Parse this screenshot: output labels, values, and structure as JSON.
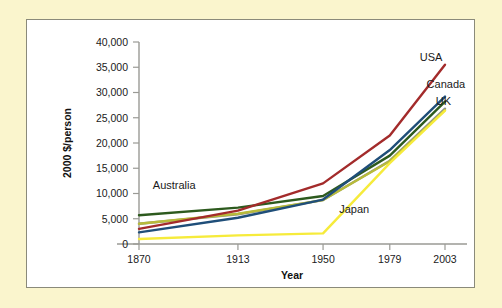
{
  "figure": {
    "background_color": "#faf5cd",
    "panel_color": "#ffffff",
    "panel_border_color": "#8a8a7a"
  },
  "chart_data": {
    "type": "line",
    "title": "",
    "xlabel": "Year",
    "ylabel": "2000 $/person",
    "categories": [
      "1870",
      "1913",
      "1950",
      "1979",
      "2003"
    ],
    "x": [
      1870,
      1913,
      1950,
      1979,
      2003
    ],
    "xlim": [
      1870,
      2003
    ],
    "ylim": [
      0,
      40000
    ],
    "yticks": [
      0,
      5000,
      10000,
      15000,
      20000,
      25000,
      30000,
      35000,
      40000
    ],
    "ytick_labels": [
      "0",
      "5,000",
      "10,000",
      "15,000",
      "20,000",
      "25,000",
      "30,000",
      "35,000",
      "40,000"
    ],
    "xtick_labels": [
      "1870",
      "1913",
      "1950",
      "1979",
      "2003"
    ],
    "grid": false,
    "legend_position": "inline-annotations",
    "series": [
      {
        "name": "USA",
        "color": "#a32b2b",
        "label": "USA",
        "values": [
          3000,
          6600,
          12000,
          21500,
          35500
        ]
      },
      {
        "name": "Canada",
        "color": "#1f4e79",
        "label": "Canada",
        "values": [
          2300,
          5200,
          8800,
          18600,
          29200
        ]
      },
      {
        "name": "Australia",
        "color": "#2d5a1e",
        "label": "Australia",
        "values": [
          5700,
          7200,
          9500,
          17500,
          28200
        ]
      },
      {
        "name": "UK",
        "color": "#b8bb3a",
        "label": "UK",
        "values": [
          4000,
          6000,
          8700,
          16400,
          26500
        ]
      },
      {
        "name": "Unlabeled-gray",
        "color": "#8f9190",
        "label": "",
        "values": [
          4000,
          5900,
          8700,
          16500,
          26800
        ]
      },
      {
        "name": "Japan",
        "color": "#f6eb3b",
        "label": "Japan",
        "values": [
          1000,
          1700,
          2100,
          16000,
          26400
        ]
      }
    ],
    "annotations": [
      {
        "text": "Australia",
        "series": "Australia",
        "x": 1876,
        "y": 10800
      },
      {
        "text": "Japan",
        "series": "Japan",
        "x": 1957,
        "y": 6100
      },
      {
        "text": "USA",
        "series": "USA",
        "x": 1992,
        "y": 36200
      },
      {
        "text": "Canada",
        "series": "Canada",
        "x": 1995,
        "y": 30800
      },
      {
        "text": "UK",
        "series": "UK",
        "x": 1999,
        "y": 27600
      }
    ]
  }
}
